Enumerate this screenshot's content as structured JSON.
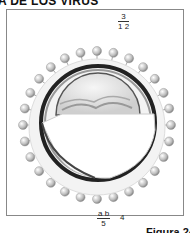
{
  "header": {
    "title": "A DE LOS VIRUS"
  },
  "figure": {
    "labels": {
      "top_fraction": {
        "numerator": "3",
        "denominator": "1 2"
      },
      "bottom_fraction": {
        "numerator": "a b",
        "denominator": "5"
      },
      "bottom_single": "4"
    },
    "caption": "Figura 24"
  }
}
